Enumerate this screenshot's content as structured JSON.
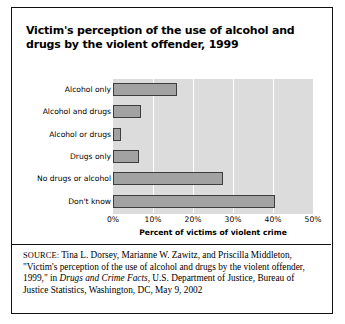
{
  "figure": {
    "title": "Victim's perception of the use of alcohol and drugs by the violent offender, 1999",
    "source": {
      "kicker": "SOURCE:",
      "part1": " Tina L. Dorsey, Marianne W. Zawitz, and Priscilla Middleton, \"Victim's perception of the use of alcohol and drugs by the violent offender, 1999,\" in ",
      "publication": "Drugs and Crime Facts",
      "part2": ", U.S. Department of Justice, Bureau of Justice Statistics, Washington, DC, May 9, 2002"
    }
  },
  "colors": {
    "plot_background": "#dcdcdc",
    "bar_fill": "#a2a2a2",
    "bar_border": "#3d3d3d",
    "gridline": "#ffffff",
    "frame": "#111111",
    "text": "#000000"
  },
  "chart_data": {
    "type": "bar",
    "orientation": "horizontal",
    "title": "Victim's perception of the use of alcohol and drugs by the violent offender, 1999",
    "xlabel": "Percent of victims of violent crime",
    "ylabel": "",
    "categories": [
      "Alcohol only",
      "Alcohol and drugs",
      "Alcohol or drugs",
      "Drugs only",
      "No drugs or alcohol",
      "Don't know"
    ],
    "values": [
      16,
      7,
      2,
      6.5,
      27.5,
      40.5
    ],
    "xlim": [
      0,
      50
    ],
    "xticks": [
      0,
      10,
      20,
      30,
      40,
      50
    ],
    "xtick_labels": [
      "0%",
      "10%",
      "20%",
      "30%",
      "40%",
      "50%"
    ],
    "grid": "vertical-white-gridlines",
    "legend": "none"
  }
}
